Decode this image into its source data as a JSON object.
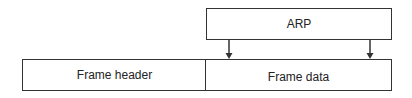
{
  "diagram": {
    "top_box": {
      "label": "ARP"
    },
    "bottom_boxes": [
      {
        "label": "Frame header"
      },
      {
        "label": "Frame data"
      }
    ],
    "arrows": [
      {
        "from": "ARP",
        "to": "Frame data",
        "position": "left"
      },
      {
        "from": "ARP",
        "to": "Frame data",
        "position": "right"
      }
    ],
    "colors": {
      "stroke": "#333333",
      "background": "#ffffff",
      "text": "#222222"
    }
  }
}
